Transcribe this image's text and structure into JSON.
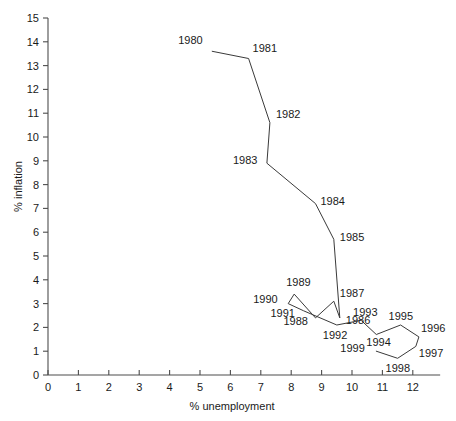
{
  "chart_data": {
    "type": "line",
    "title": "",
    "xlabel": "% unemployment",
    "ylabel": "% inflation",
    "xlim": [
      0,
      12.9
    ],
    "ylim": [
      0,
      15
    ],
    "grid": false,
    "legend": "none",
    "xticks": [
      0,
      1,
      2,
      3,
      4,
      5,
      6,
      7,
      8,
      9,
      10,
      11,
      12
    ],
    "yticks": [
      0,
      1,
      2,
      3,
      4,
      5,
      6,
      7,
      8,
      9,
      10,
      11,
      12,
      13,
      14,
      15
    ],
    "xtick_labels": [
      "0",
      "1",
      "2",
      "3",
      "4",
      "5",
      "6",
      "7",
      "8",
      "9",
      "10",
      "11",
      "12"
    ],
    "ytick_labels": [
      "0",
      "1",
      "2",
      "3",
      "4",
      "5",
      "6",
      "7",
      "8",
      "9",
      "10",
      "11",
      "12",
      "13",
      "14",
      "15"
    ],
    "series": [
      {
        "name": "UK Phillips curve 1980-1999",
        "points": [
          {
            "label": "1980",
            "x": 5.4,
            "y": 13.6,
            "lx": -34,
            "ly": -7
          },
          {
            "label": "1981",
            "x": 6.6,
            "y": 13.3,
            "lx": 4,
            "ly": -7
          },
          {
            "label": "1982",
            "x": 7.3,
            "y": 10.6,
            "lx": 6,
            "ly": -5
          },
          {
            "label": "1983",
            "x": 7.2,
            "y": 8.9,
            "lx": -34,
            "ly": 1
          },
          {
            "label": "1984",
            "x": 8.8,
            "y": 7.2,
            "lx": 5,
            "ly": 1
          },
          {
            "label": "1985",
            "x": 9.4,
            "y": 5.7,
            "lx": 6,
            "ly": 2
          },
          {
            "label": "1986",
            "x": 9.6,
            "y": 2.4,
            "lx": 6,
            "ly": 6
          },
          {
            "label": "1987",
            "x": 9.4,
            "y": 3.1,
            "lx": 6,
            "ly": -4
          },
          {
            "label": "1988",
            "x": 8.8,
            "y": 2.4,
            "lx": -32,
            "ly": 7
          },
          {
            "label": "1989",
            "x": 8.1,
            "y": 3.4,
            "lx": -8,
            "ly": -8
          },
          {
            "label": "1990",
            "x": 7.9,
            "y": 3.0,
            "lx": -35,
            "ly": -1
          },
          {
            "label": "1991",
            "x": 8.4,
            "y": 2.7,
            "lx": -33,
            "ly": 6
          },
          {
            "label": "1992",
            "x": 9.5,
            "y": 2.1,
            "lx": -14,
            "ly": 14
          },
          {
            "label": "1993",
            "x": 10.3,
            "y": 2.3,
            "lx": -8,
            "ly": -4
          },
          {
            "label": "1994",
            "x": 10.8,
            "y": 1.7,
            "lx": -10,
            "ly": 11
          },
          {
            "label": "1995",
            "x": 11.6,
            "y": 2.1,
            "lx": -12,
            "ly": -5
          },
          {
            "label": "1996",
            "x": 12.2,
            "y": 1.6,
            "lx": 2,
            "ly": -5
          },
          {
            "label": "1997",
            "x": 12.1,
            "y": 1.2,
            "lx": 3,
            "ly": 11
          },
          {
            "label": "1998",
            "x": 11.5,
            "y": 0.7,
            "lx": -12,
            "ly": 14
          },
          {
            "label": "1999",
            "x": 10.8,
            "y": 1.0,
            "lx": -36,
            "ly": 1
          }
        ]
      }
    ]
  },
  "colors": {
    "line": "#3a3a3a",
    "axis": "#4d4d4d",
    "text": "#1a1a1a",
    "background": "#ffffff"
  }
}
